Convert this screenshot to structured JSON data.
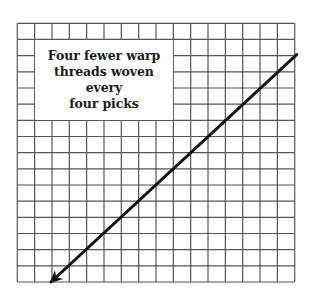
{
  "diagram": {
    "type": "weaving-draft-grid",
    "grid": {
      "columns": 16,
      "rows": 16,
      "line_color": "#555555",
      "background": "#ffffff"
    },
    "label": {
      "text": "Four fewer warp\nthreads woven every\nfour picks",
      "cell_span": {
        "col_start": 1,
        "col_end": 9,
        "row_start": 1,
        "row_end": 6
      }
    },
    "arrow": {
      "from_cell": {
        "col": 16,
        "row": 2
      },
      "to_cell": {
        "col": 2,
        "row": 16
      },
      "direction": "down-left",
      "color": "#111111"
    }
  }
}
